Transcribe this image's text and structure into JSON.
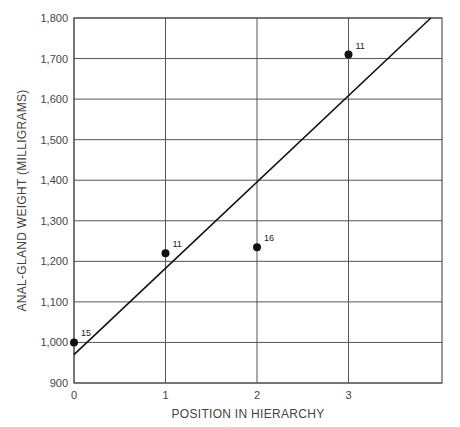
{
  "chart_data": {
    "type": "scatter",
    "title": "",
    "xlabel": "POSITION IN HIERARCHY",
    "ylabel": "ANAL-GLAND WEIGHT (MILLIGRAMS)",
    "xlim": [
      0,
      4
    ],
    "ylim": [
      900,
      1800
    ],
    "x_ticks": [
      "0",
      "1",
      "2",
      "3"
    ],
    "y_ticks": [
      "900",
      "1,000",
      "1,100",
      "1,200",
      "1,300",
      "1,400",
      "1,500",
      "1,600",
      "1,700",
      "1,800"
    ],
    "grid": true,
    "legend": null,
    "series": [
      {
        "name": "Anal-gland weight",
        "points": [
          {
            "x": 0,
            "y": 1000,
            "label": "15"
          },
          {
            "x": 1,
            "y": 1220,
            "label": "11"
          },
          {
            "x": 2,
            "y": 1235,
            "label": "16"
          },
          {
            "x": 3,
            "y": 1710,
            "label": "11"
          }
        ]
      }
    ],
    "fit_line": {
      "x0": 0,
      "y0": 970,
      "x1": 3.9,
      "y1": 1800
    }
  }
}
